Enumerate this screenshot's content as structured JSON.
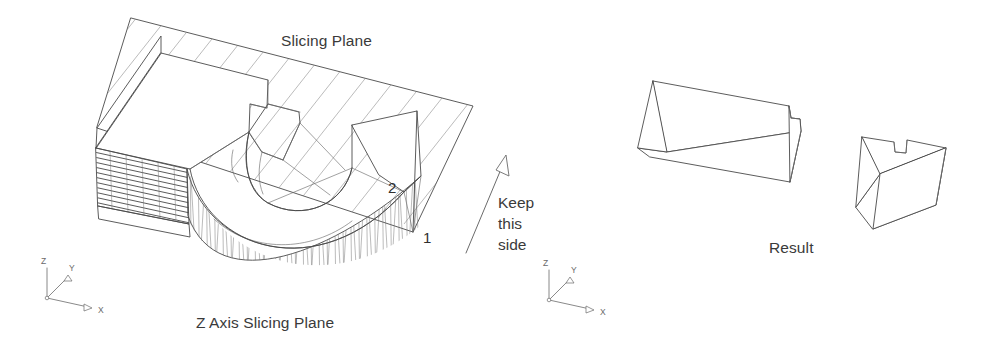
{
  "figure": {
    "width": 984,
    "height": 353,
    "background": "#ffffff",
    "line_color": "#4a4a4a",
    "thin_line_color": "#6d6d6d",
    "text_color": "#3a3a3a",
    "axis_color": "#6b6b6b"
  },
  "labels": {
    "slicing_plane": "Slicing Plane",
    "z_axis_slicing_plane": "Z Axis Slicing Plane",
    "keep_line_1": "Keep",
    "keep_line_2": "this",
    "keep_line_3": "side",
    "result": "Result",
    "callout_1": "1",
    "callout_2": "2"
  },
  "axis_triads": [
    {
      "name": "left-axis-triad",
      "origin_x": 47,
      "origin_y": 298,
      "z_label": "Z",
      "y_label": "Y",
      "x_label": "X"
    },
    {
      "name": "right-axis-triad",
      "origin_x": 549,
      "origin_y": 300,
      "z_label": "Z",
      "y_label": "Y",
      "x_label": "X"
    }
  ],
  "scene_left": {
    "name": "sliced-part-view",
    "description": "U-shaped (horseshoe) solid part intersected by a hatched Z axis slicing plane",
    "part_shape": "horseshoe",
    "hatch_spacing": 26,
    "hatch_angle_deg": 52,
    "layer_lines_count": 11,
    "zigzag_teeth_count": 30,
    "callouts": [
      {
        "text": "2",
        "x": 393,
        "y": 193
      },
      {
        "text": "1",
        "x": 427,
        "y": 242
      }
    ]
  },
  "scene_right": {
    "name": "result-view",
    "description": "Two resulting cross-section slabs after slicing, each with a notch",
    "pieces": [
      {
        "name": "result-piece-large",
        "notch": true
      },
      {
        "name": "result-piece-small",
        "notch": true
      }
    ]
  }
}
